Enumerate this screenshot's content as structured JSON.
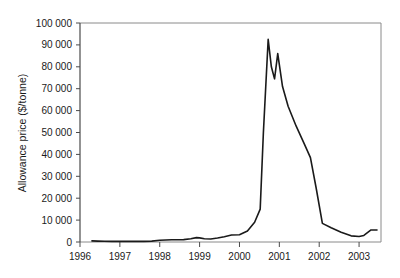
{
  "chart_data": {
    "type": "line",
    "title": "",
    "xlabel": "",
    "ylabel": "Allowance price ($/tonne)",
    "xlim": [
      1996.0,
      2003.55
    ],
    "ylim": [
      0,
      100000
    ],
    "grid": false,
    "legend": null,
    "legend_position": "none",
    "line_color": "#1a1a1a",
    "axis_color": "#808080",
    "y_ticks": [
      0,
      10000,
      20000,
      30000,
      40000,
      50000,
      60000,
      70000,
      80000,
      90000,
      100000
    ],
    "y_tick_labels": [
      "0",
      "10 000",
      "20 000",
      "30 000",
      "40 000",
      "50 000",
      "60 000",
      "70 000",
      "80 000",
      "90 000",
      "100 000"
    ],
    "x_ticks": [
      1996,
      1997,
      1998,
      1999,
      2000,
      2001,
      2002,
      2003
    ],
    "x_tick_labels": [
      "1996",
      "1997",
      "1998",
      "1999",
      "2000",
      "2001",
      "2002",
      "2003"
    ],
    "series": [
      {
        "name": "Allowance price",
        "x": [
          1996.3,
          1996.45,
          1996.62,
          1996.8,
          1997.0,
          1997.2,
          1997.4,
          1997.6,
          1997.8,
          1998.0,
          1998.15,
          1998.3,
          1998.45,
          1998.6,
          1998.78,
          1998.92,
          1999.0,
          1999.12,
          1999.28,
          1999.45,
          1999.62,
          1999.8,
          2000.0,
          2000.2,
          2000.38,
          2000.52,
          2000.6,
          2000.72,
          2000.8,
          2000.88,
          2000.96,
          2001.08,
          2001.22,
          2001.42,
          2001.62,
          2001.78,
          2001.92,
          2002.08,
          2002.3,
          2002.55,
          2002.8,
          2003.0,
          2003.12,
          2003.3,
          2003.45
        ],
        "y": [
          500,
          400,
          350,
          300,
          300,
          300,
          300,
          300,
          400,
          800,
          900,
          1000,
          1000,
          1100,
          1500,
          2000,
          1900,
          1500,
          1400,
          1800,
          2400,
          3200,
          3300,
          5000,
          9000,
          15000,
          50000,
          92500,
          80000,
          74500,
          86000,
          71000,
          62000,
          53000,
          45000,
          38500,
          25000,
          8500,
          6500,
          4500,
          2800,
          2500,
          3000,
          5500,
          5500
        ]
      }
    ],
    "annotations": []
  },
  "plot_geometry": {
    "left": 80,
    "right": 381,
    "top": 23,
    "bottom": 242
  }
}
